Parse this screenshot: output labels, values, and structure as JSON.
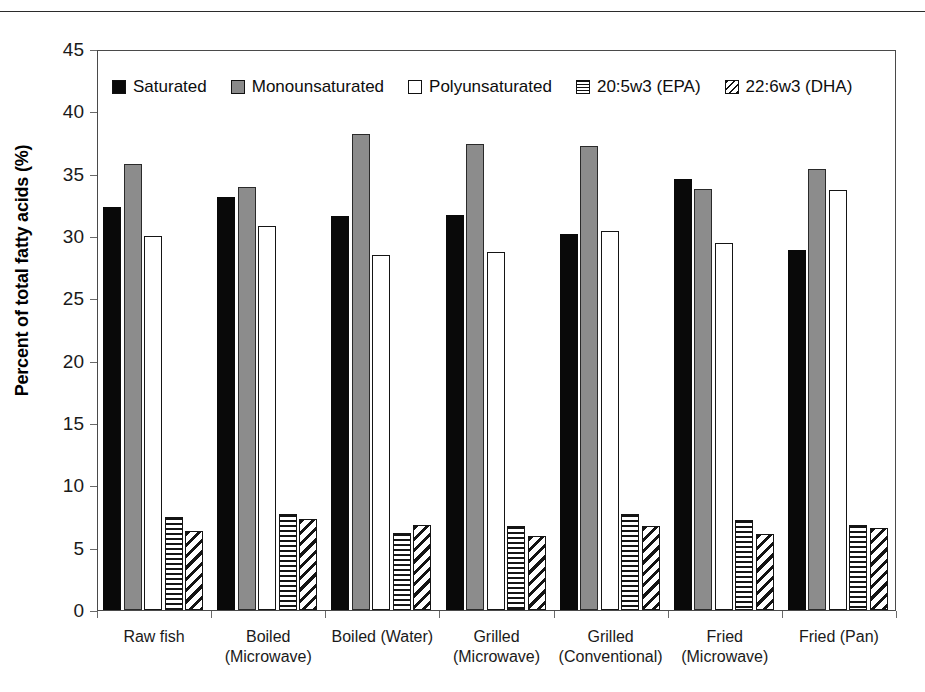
{
  "chart_data": {
    "type": "bar",
    "title": "",
    "xlabel": "",
    "ylabel": "Percent of total fatty acids (%)",
    "ylim": [
      0,
      45
    ],
    "yticks": [
      0,
      5,
      10,
      15,
      20,
      25,
      30,
      35,
      40,
      45
    ],
    "grid": false,
    "legend_position": "top-left inside plot area",
    "categories": [
      "Raw fish",
      "Boiled (Microwave)",
      "Boiled (Water)",
      "Grilled (Microwave)",
      "Grilled (Conventional)",
      "Fried (Microwave)",
      "Fried (Pan)"
    ],
    "categories_lines": [
      [
        "Raw  fish"
      ],
      [
        "Boiled",
        "(Microwave)"
      ],
      [
        "Boiled (Water)"
      ],
      [
        "Grilled",
        "(Microwave)"
      ],
      [
        "Grilled",
        "(Conventional)"
      ],
      [
        "Fried",
        "(Microwave)"
      ],
      [
        "Fried (Pan)"
      ]
    ],
    "series": [
      {
        "name": "Saturated",
        "pattern": "solid-black",
        "color": "#090909",
        "values": [
          32.3,
          33.1,
          31.6,
          31.7,
          30.2,
          34.6,
          28.9
        ]
      },
      {
        "name": "Monounsaturated",
        "pattern": "solid-gray",
        "color": "#8c8c8c",
        "values": [
          35.8,
          33.9,
          38.2,
          37.4,
          37.2,
          33.8,
          35.4
        ]
      },
      {
        "name": "Polyunsaturated",
        "pattern": "solid-white",
        "color": "#ffffff",
        "values": [
          30.0,
          30.8,
          28.5,
          28.7,
          30.4,
          29.4,
          33.7
        ]
      },
      {
        "name": "20:5w3 (EPA)",
        "pattern": "horizontal-hatch",
        "color": "#141414",
        "values": [
          7.5,
          7.7,
          6.2,
          6.7,
          7.7,
          7.2,
          6.8
        ]
      },
      {
        "name": "22:6w3 (DHA)",
        "pattern": "diagonal-hatch",
        "color": "#141414",
        "values": [
          6.3,
          7.3,
          6.8,
          5.9,
          6.7,
          6.1,
          6.6
        ]
      }
    ]
  },
  "legend": {
    "items": [
      {
        "label": "Saturated",
        "swatch": "legend-swatch-saturated"
      },
      {
        "label": "Monounsaturated",
        "swatch": "legend-swatch-monounsaturated"
      },
      {
        "label": "Polyunsaturated",
        "swatch": "legend-swatch-polyunsaturated"
      },
      {
        "label": "20:5w3 (EPA)",
        "swatch": "legend-swatch-epa"
      },
      {
        "label": "22:6w3 (DHA)",
        "swatch": "legend-swatch-dha"
      }
    ]
  }
}
